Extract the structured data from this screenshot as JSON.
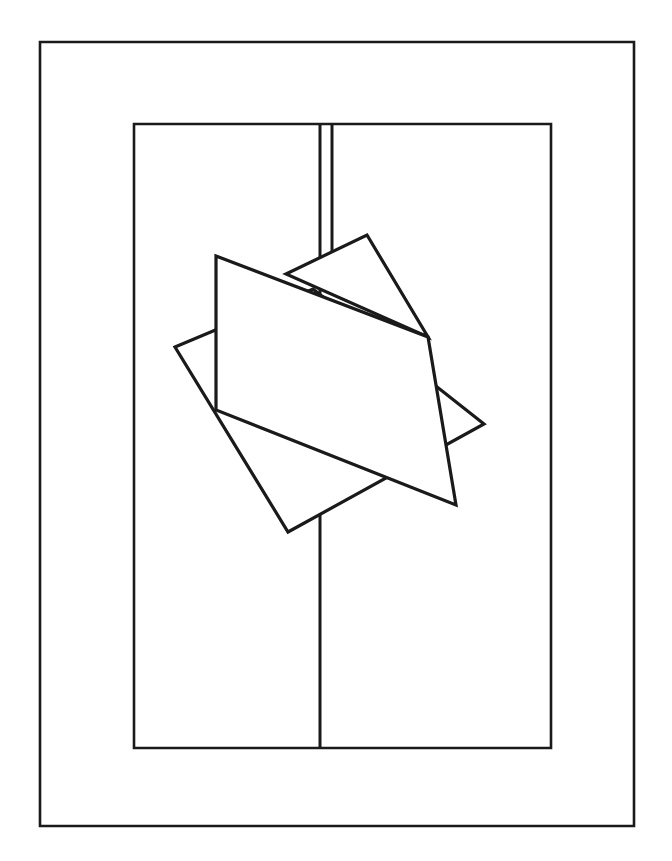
{
  "document": {
    "title": "Line Drawing — Nested Frames with Overlapping Polygons",
    "description": "Black-and-white line art: an outer rectangular border frame encloses an inner tall rectangle. A vertical divider line runs down the middle of the inner rectangle, doubled near the top. Three overlapping straight-edged polygons — a triangle, a large rotated rectangle, and a rotated square — sit over the center of the composition.",
    "background_color": "#ffffff",
    "stroke_color": "#1a1a1a",
    "width": 672,
    "height": 861
  },
  "figure": {
    "stroke_color": "#1a1a1a",
    "fill_color": "#ffffff",
    "outer_frame": {
      "label": "Outer border frame",
      "x": 40,
      "y": 42,
      "width": 594,
      "height": 784,
      "stroke_width": 2.6
    },
    "inner_rectangle": {
      "label": "Inner tall rectangle",
      "x": 134,
      "y": 124,
      "width": 417,
      "height": 624,
      "stroke_width": 2.6
    },
    "divider_left": {
      "label": "Left vertical divider segment",
      "x": 320,
      "y1": 124,
      "y2": 748,
      "stroke_width": 3.0
    },
    "divider_right": {
      "label": "Right vertical divider segment (double line, upper portion)",
      "x": 332,
      "y1": 124,
      "y2": 262,
      "stroke_width": 3.0
    },
    "triangle": {
      "label": "Triangle polygon",
      "points": "367,235 428,337 286,274",
      "stroke_width": 3.2
    },
    "rotated_square": {
      "label": "Rotated square polygon",
      "points": "175,347 313,289 484,424 288,532",
      "stroke_width": 3.2
    },
    "large_quadrilateral": {
      "label": "Large rotated rectangle polygon",
      "points": "216,256 428,337 456,505 216,410",
      "stroke_width": 3.2
    }
  }
}
